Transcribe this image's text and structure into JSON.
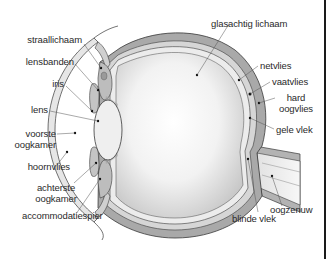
{
  "diagram": {
    "colors": {
      "background": "#ffffff",
      "sclera": "#a9a9a9",
      "choroid": "#d6d6d6",
      "retina": "#e9e9e9",
      "vitreous_center": "#ffffff",
      "vitreous_edge": "#c9c9c9",
      "outline": "#3a3a3a",
      "label_text": "#2a2a2a",
      "border": "#1a1a1a"
    },
    "labels": {
      "straallichaam": "straallichaam",
      "lensbanden": "lensbanden",
      "iris": "iris",
      "lens": "lens",
      "voorste_oogkamer_1": "voorste",
      "voorste_oogkamer_2": "oogkamer",
      "hoornvlies": "hoornvlies",
      "achterste_oogkamer_1": "achterste",
      "achterste_oogkamer_2": "oogkamer",
      "accommodatiespier": "accommodatiespier",
      "glasachtig_lichaam": "glasachtig lichaam",
      "netvlies": "netvlies",
      "vaatvlies": "vaatvlies",
      "hard_oogvlies_1": "hard",
      "hard_oogvlies_2": "oogvlies",
      "gele_vlek": "gele vlek",
      "oogzenuw": "oogzenuw",
      "blinde_vlek": "blinde vlek"
    }
  }
}
